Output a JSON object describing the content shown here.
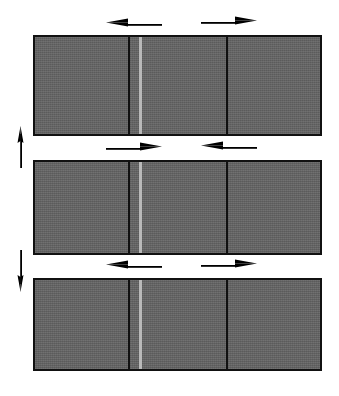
{
  "figure": {
    "background_color": "#ffffff",
    "block_fill_color": "#636363",
    "block_border_color": "#111111",
    "divider_dark_color": "#111111",
    "divider_light_color": "#b9b9b9",
    "arrow_color": "#000000"
  },
  "rows": [
    {
      "id": "row-1",
      "label": "Top band",
      "segments": [
        {
          "id": "row-1-segment-1",
          "label": "left segment"
        },
        {
          "id": "row-1-segment-2",
          "label": "middle segment"
        },
        {
          "id": "row-1-segment-3",
          "label": "right segment"
        }
      ],
      "arrows": [
        {
          "id": "row-1-arrow-left",
          "direction": "left",
          "position": "above-left"
        },
        {
          "id": "row-1-arrow-right",
          "direction": "right",
          "position": "above-right"
        }
      ]
    },
    {
      "id": "row-2",
      "label": "Middle band",
      "segments": [
        {
          "id": "row-2-segment-1",
          "label": "left segment"
        },
        {
          "id": "row-2-segment-2",
          "label": "middle segment"
        },
        {
          "id": "row-2-segment-3",
          "label": "right segment"
        }
      ],
      "arrows": [
        {
          "id": "row-2-arrow-left",
          "direction": "right",
          "position": "above-left"
        },
        {
          "id": "row-2-arrow-right",
          "direction": "left",
          "position": "above-right"
        }
      ]
    },
    {
      "id": "row-3",
      "label": "Bottom band",
      "segments": [
        {
          "id": "row-3-segment-1",
          "label": "left segment"
        },
        {
          "id": "row-3-segment-2",
          "label": "middle segment"
        },
        {
          "id": "row-3-segment-3",
          "label": "right segment"
        }
      ],
      "arrows": [
        {
          "id": "row-3-arrow-left",
          "direction": "left",
          "position": "above-left"
        },
        {
          "id": "row-3-arrow-right",
          "direction": "right",
          "position": "above-right"
        }
      ]
    }
  ],
  "vertical_arrows": [
    {
      "id": "vertical-arrow-up",
      "direction": "up",
      "between": "row-1 and row-2"
    },
    {
      "id": "vertical-arrow-down",
      "direction": "down",
      "between": "row-2 and row-3"
    }
  ]
}
